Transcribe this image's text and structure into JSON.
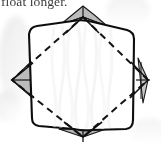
{
  "page": {
    "kind": "scanned-book-figure",
    "width": 161,
    "height": 152,
    "background_color": "#ffffff"
  },
  "caption": {
    "text": "float longer.",
    "clipped": "top",
    "color": "#1a1a1a"
  },
  "figure": {
    "name": "folded-paper-octagon-diagram",
    "colors": {
      "outline": "#101010",
      "shaded_flap_fill": "#b9b9b9",
      "shaded_flap_fill_light": "#cfcfcf",
      "dashed_crease": "#141414",
      "paper_fill": "#ffffff",
      "scan_shadow": "#e4e4e4",
      "texture_wave": "#f1f1f1"
    },
    "stroke_widths": {
      "outline": 2.1,
      "dashed_crease": 2.0,
      "flap_edge": 1.1
    },
    "dash_pattern": "7 5",
    "vertices": {
      "top": [
        83,
        17
      ],
      "right": [
        148,
        80
      ],
      "bottom": [
        83,
        137
      ],
      "left": [
        12,
        80
      ]
    },
    "octagon_corners": {
      "top_left": [
        28,
        28
      ],
      "top_right": [
        134,
        33
      ],
      "bottom_right": [
        131,
        128
      ],
      "bottom_left": [
        32,
        122
      ]
    },
    "flaps": [
      {
        "name": "top-flap",
        "position": "top",
        "fill": "#b9b9b9"
      },
      {
        "name": "right-flap",
        "position": "right",
        "fill": "#c4c4c4"
      },
      {
        "name": "bottom-flap",
        "position": "bottom",
        "fill": "#b2b2b2"
      },
      {
        "name": "left-flap",
        "position": "left",
        "fill": "#bcbcbc"
      }
    ],
    "crease_square": {
      "style": "dashed",
      "points": "83,17 148,80 83,137 12,80"
    }
  }
}
